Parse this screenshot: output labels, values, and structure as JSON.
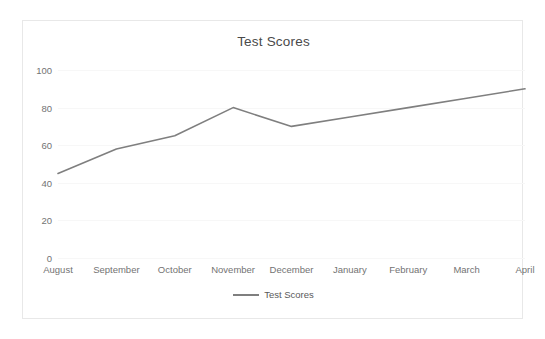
{
  "chart_data": {
    "type": "line",
    "title": "Test Scores",
    "xlabel": "",
    "ylabel": "",
    "categories": [
      "August",
      "September",
      "October",
      "November",
      "December",
      "January",
      "February",
      "March",
      "April"
    ],
    "series": [
      {
        "name": "Test Scores",
        "values": [
          45,
          58,
          65,
          80,
          70,
          75,
          80,
          85,
          90
        ],
        "color": "#7f7f7f"
      }
    ],
    "yticks": [
      0,
      20,
      40,
      60,
      80,
      100
    ],
    "ytick_labels": [
      "0",
      "20",
      "40",
      "60",
      "80",
      "100"
    ],
    "ylim": [
      0,
      100
    ],
    "grid": true,
    "legend": {
      "position": "bottom",
      "entries": [
        "Test Scores"
      ]
    },
    "colors": {
      "line": "#7f7f7f",
      "grid": "#f7f7f7",
      "border": "#e8e8e8",
      "title_text": "#4a4a4a",
      "tick_text": "#737373",
      "legend_text": "#5a5a5a",
      "background": "#ffffff"
    }
  }
}
